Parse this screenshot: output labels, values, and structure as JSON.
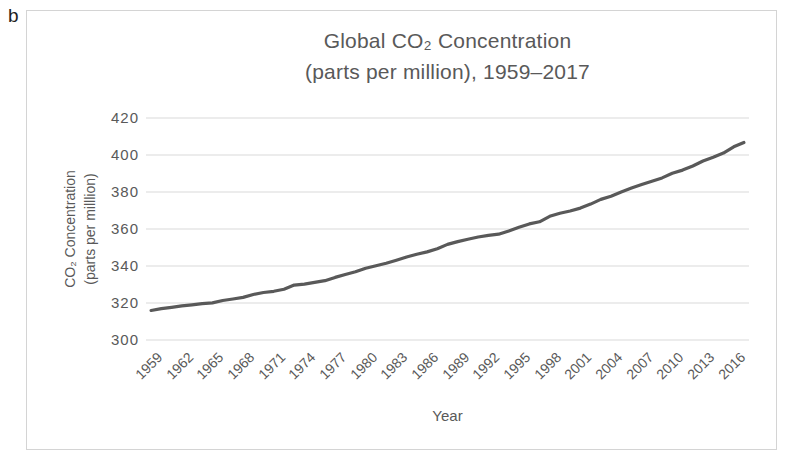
{
  "figure_label": "b",
  "colors": {
    "line": "#595959",
    "grid": "#d9d9d9",
    "text": "#595959",
    "frame_border": "#d4d4d4"
  },
  "chart_data": {
    "type": "line",
    "title_line1": "Global CO₂ Concentration",
    "title_line2": "(parts per million), 1959–2017",
    "xlabel": "Year",
    "ylabel_line1": "CO₂ Concentration",
    "ylabel_line2": "(parts per milllion)",
    "ylim": [
      300,
      420
    ],
    "yticks": [
      420,
      400,
      380,
      360,
      340,
      320,
      300
    ],
    "xticks": [
      1959,
      1962,
      1965,
      1968,
      1971,
      1974,
      1977,
      1980,
      1983,
      1986,
      1989,
      1992,
      1995,
      1998,
      2001,
      2004,
      2007,
      2010,
      2013,
      2016
    ],
    "grid": true,
    "legend": "none",
    "x": [
      1959,
      1960,
      1961,
      1962,
      1963,
      1964,
      1965,
      1966,
      1967,
      1968,
      1969,
      1970,
      1971,
      1972,
      1973,
      1974,
      1975,
      1976,
      1977,
      1978,
      1979,
      1980,
      1981,
      1982,
      1983,
      1984,
      1985,
      1986,
      1987,
      1988,
      1989,
      1990,
      1991,
      1992,
      1993,
      1994,
      1995,
      1996,
      1997,
      1998,
      1999,
      2000,
      2001,
      2002,
      2003,
      2004,
      2005,
      2006,
      2007,
      2008,
      2009,
      2010,
      2011,
      2012,
      2013,
      2014,
      2015,
      2016,
      2017
    ],
    "values": [
      315.97,
      316.91,
      317.64,
      318.45,
      318.99,
      319.62,
      320.04,
      321.37,
      322.18,
      323.05,
      324.62,
      325.68,
      326.32,
      327.46,
      329.68,
      330.19,
      331.12,
      332.03,
      333.84,
      335.41,
      336.84,
      338.76,
      340.12,
      341.48,
      343.15,
      344.87,
      346.35,
      347.61,
      349.31,
      351.69,
      353.2,
      354.45,
      355.7,
      356.54,
      357.21,
      358.96,
      360.97,
      362.74,
      363.88,
      366.84,
      368.54,
      369.71,
      371.32,
      373.45,
      375.98,
      377.7,
      379.98,
      382.09,
      384.02,
      385.83,
      387.64,
      390.1,
      391.85,
      394.06,
      396.74,
      398.81,
      401.01,
      404.41,
      406.76
    ]
  }
}
